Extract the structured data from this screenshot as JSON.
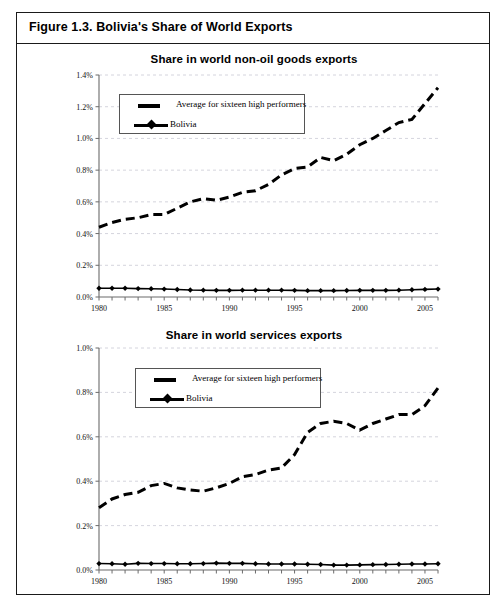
{
  "figure": {
    "title": "Figure 1.3. Bolivia's Share of World Exports",
    "border_color": "#1a1a1a"
  },
  "legend": {
    "series_a_label": "Average for sixteen high performers",
    "series_b_label": "Bolivia",
    "position": "upper-left-inside"
  },
  "chart_data": [
    {
      "id": "chart-non-oil-goods",
      "type": "line",
      "title": "Share in world non-oil goods exports",
      "xlabel": "",
      "ylabel": "",
      "xlim": [
        1980,
        2006
      ],
      "ylim": [
        0.0,
        1.4
      ],
      "y_unit": "%",
      "grid": true,
      "x_tick_labels": [
        "1980",
        "1985",
        "1990",
        "1995",
        "2000",
        "2005"
      ],
      "x_tick_values": [
        1980,
        1985,
        1990,
        1995,
        2000,
        2005
      ],
      "y_tick_labels": [
        "0.0%",
        "0.2%",
        "0.4%",
        "0.6%",
        "0.8%",
        "1.0%",
        "1.2%",
        "1.4%"
      ],
      "y_tick_values": [
        0.0,
        0.2,
        0.4,
        0.6,
        0.8,
        1.0,
        1.2,
        1.4
      ],
      "x": [
        1980,
        1981,
        1982,
        1983,
        1984,
        1985,
        1986,
        1987,
        1988,
        1989,
        1990,
        1991,
        1992,
        1993,
        1994,
        1995,
        1996,
        1997,
        1998,
        1999,
        2000,
        2001,
        2002,
        2003,
        2004,
        2005,
        2006
      ],
      "series": [
        {
          "name": "Average for sixteen high performers",
          "style": "dashed",
          "values": [
            0.44,
            0.47,
            0.49,
            0.5,
            0.52,
            0.52,
            0.56,
            0.6,
            0.62,
            0.61,
            0.63,
            0.66,
            0.67,
            0.71,
            0.77,
            0.81,
            0.82,
            0.88,
            0.86,
            0.9,
            0.96,
            1.0,
            1.05,
            1.1,
            1.12,
            1.22,
            1.32
          ]
        },
        {
          "name": "Bolivia",
          "style": "solid-markers",
          "values": [
            0.055,
            0.055,
            0.055,
            0.053,
            0.052,
            0.05,
            0.047,
            0.044,
            0.043,
            0.042,
            0.042,
            0.043,
            0.043,
            0.043,
            0.043,
            0.042,
            0.04,
            0.04,
            0.04,
            0.041,
            0.042,
            0.042,
            0.042,
            0.043,
            0.046,
            0.048,
            0.05
          ]
        }
      ]
    },
    {
      "id": "chart-services",
      "type": "line",
      "title": "Share in world services exports",
      "xlabel": "",
      "ylabel": "",
      "xlim": [
        1980,
        2006
      ],
      "ylim": [
        0.0,
        1.0
      ],
      "y_unit": "%",
      "grid": true,
      "x_tick_labels": [
        "1980",
        "1985",
        "1990",
        "1995",
        "2000",
        "2005"
      ],
      "x_tick_values": [
        1980,
        1985,
        1990,
        1995,
        2000,
        2005
      ],
      "y_tick_labels": [
        "0.0%",
        "0.2%",
        "0.4%",
        "0.6%",
        "0.8%",
        "1.0%"
      ],
      "y_tick_values": [
        0.0,
        0.2,
        0.4,
        0.6,
        0.8,
        1.0
      ],
      "x": [
        1980,
        1981,
        1982,
        1983,
        1984,
        1985,
        1986,
        1987,
        1988,
        1989,
        1990,
        1991,
        1992,
        1993,
        1994,
        1995,
        1996,
        1997,
        1998,
        1999,
        2000,
        2001,
        2002,
        2003,
        2004,
        2005,
        2006
      ],
      "series": [
        {
          "name": "Average for sixteen high performers",
          "style": "dashed",
          "values": [
            0.28,
            0.32,
            0.34,
            0.35,
            0.38,
            0.39,
            0.37,
            0.36,
            0.355,
            0.37,
            0.39,
            0.42,
            0.43,
            0.45,
            0.46,
            0.52,
            0.62,
            0.66,
            0.67,
            0.66,
            0.63,
            0.66,
            0.68,
            0.7,
            0.7,
            0.74,
            0.82
          ]
        },
        {
          "name": "Bolivia",
          "style": "solid-markers",
          "values": [
            0.029,
            0.028,
            0.026,
            0.03,
            0.029,
            0.029,
            0.028,
            0.028,
            0.029,
            0.031,
            0.03,
            0.03,
            0.028,
            0.027,
            0.027,
            0.027,
            0.026,
            0.025,
            0.022,
            0.022,
            0.023,
            0.024,
            0.025,
            0.026,
            0.027,
            0.027,
            0.028
          ]
        }
      ]
    }
  ]
}
